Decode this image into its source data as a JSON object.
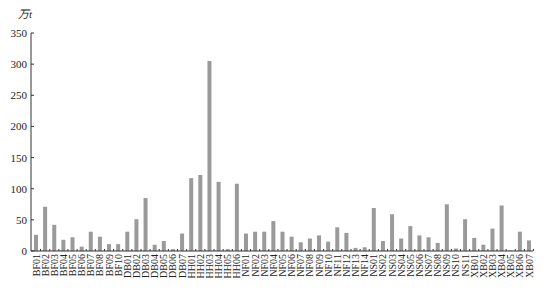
{
  "chart_data": {
    "type": "bar",
    "title": "",
    "xlabel": "",
    "ylabel": "万t",
    "ylim": [
      0,
      350
    ],
    "yticks": [
      0,
      50,
      100,
      150,
      200,
      250,
      300,
      350
    ],
    "grid": false,
    "legend": null,
    "bar_color": "#9a9a9a",
    "categories": [
      "BF01",
      "BF02",
      "BF03",
      "BF04",
      "BF05",
      "BF06",
      "BF07",
      "BF08",
      "BF09",
      "BF10",
      "DB01",
      "DB02",
      "DB03",
      "DB04",
      "DB05",
      "DB06",
      "DB07",
      "HH01",
      "HH02",
      "HH03",
      "HH04",
      "HH05",
      "HH06",
      "NF01",
      "NF02",
      "NF03",
      "NF04",
      "NF05",
      "NF06",
      "NF07",
      "NF08",
      "NF09",
      "NF10",
      "NF11",
      "NF12",
      "NF13",
      "NF14",
      "NS01",
      "NS02",
      "NS03",
      "NS04",
      "NS05",
      "NS06",
      "NS07",
      "NS08",
      "NS09",
      "NS10",
      "NS11",
      "XB01",
      "XB02",
      "XB03",
      "XB04",
      "XB05",
      "XB06",
      "XB07"
    ],
    "values": [
      26,
      71,
      42,
      18,
      22,
      7,
      31,
      23,
      11,
      11,
      31,
      51,
      85,
      10,
      16,
      3,
      28,
      117,
      122,
      305,
      111,
      3,
      108,
      28,
      31,
      31,
      48,
      31,
      23,
      14,
      20,
      25,
      15,
      38,
      29,
      5,
      6,
      69,
      16,
      59,
      20,
      40,
      25,
      22,
      13,
      75,
      4,
      51,
      21,
      10,
      36,
      73,
      1,
      31,
      17
    ]
  }
}
